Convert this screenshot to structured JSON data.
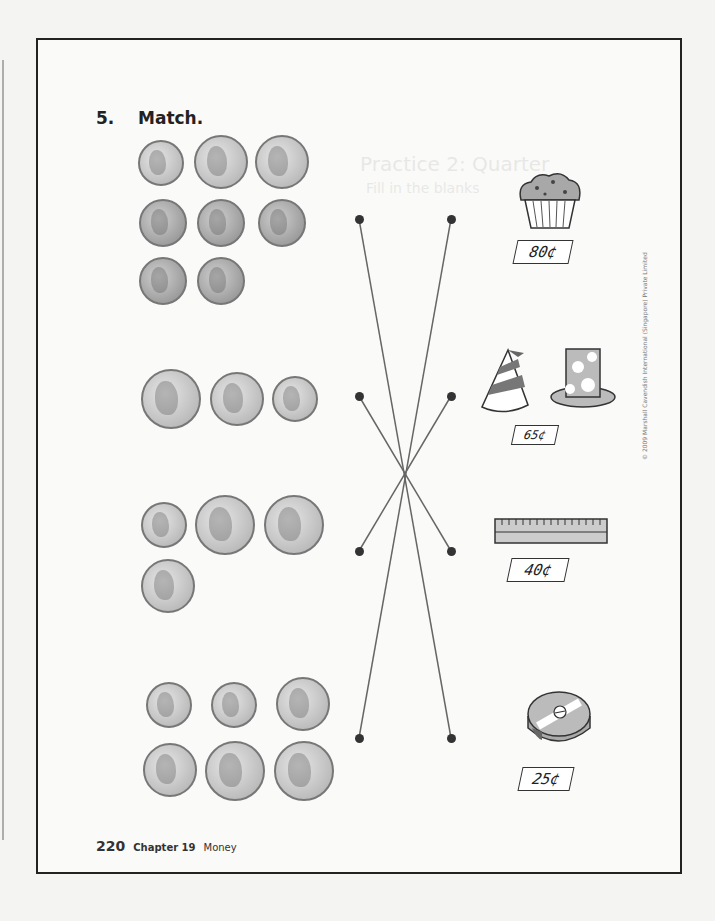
{
  "exercise": {
    "number": "5.",
    "instruction": "Match."
  },
  "coin_groups": [
    {
      "coins": [
        "dime",
        "nickel",
        "nickel",
        "penny",
        "penny",
        "penny",
        "penny",
        "penny"
      ],
      "total_cents": 25
    },
    {
      "coins": [
        "quarter",
        "nickel",
        "dime"
      ],
      "total_cents": 40
    },
    {
      "coins": [
        "dime",
        "quarter",
        "quarter",
        "nickel"
      ],
      "total_cents": 65
    },
    {
      "coins": [
        "dime",
        "dime",
        "nickel",
        "nickel",
        "quarter",
        "quarter"
      ],
      "total_cents": 80
    }
  ],
  "items": [
    {
      "name": "muffin",
      "price": "80¢"
    },
    {
      "name": "party-hats",
      "price": "65¢"
    },
    {
      "name": "ruler",
      "price": "40¢"
    },
    {
      "name": "pencil-sharpener",
      "price": "25¢"
    }
  ],
  "matches": [
    [
      0,
      3
    ],
    [
      1,
      2
    ],
    [
      2,
      1
    ],
    [
      3,
      0
    ]
  ],
  "ghost_text": {
    "heading": "Practice 2: Quarter",
    "sub": "Fill in the blanks"
  },
  "footer": {
    "page": "220",
    "chapter": "Chapter 19",
    "topic": "Money"
  },
  "copyright": "© 2009 Marshall Cavendish International (Singapore) Private Limited"
}
